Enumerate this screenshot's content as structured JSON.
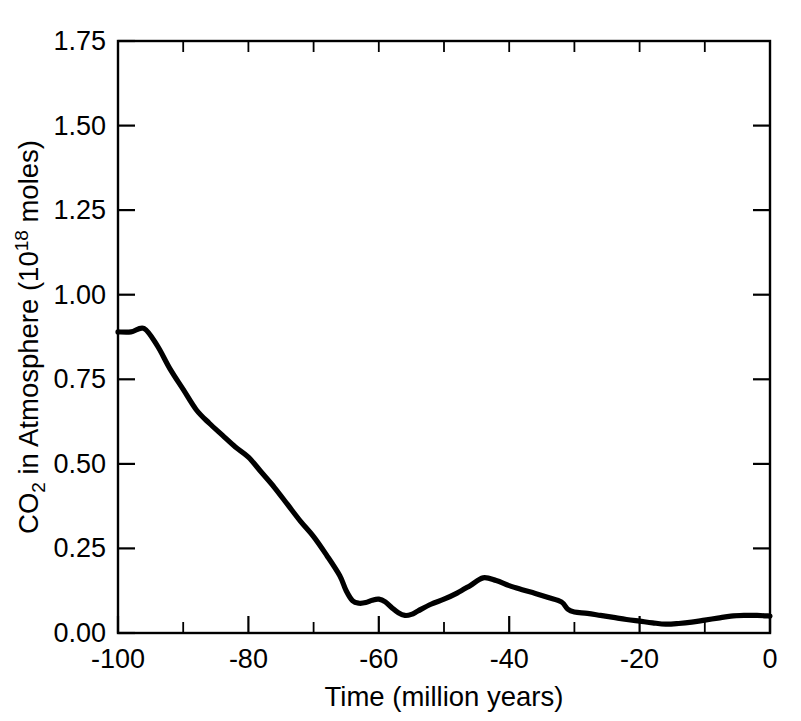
{
  "chart_data": {
    "type": "line",
    "title": "",
    "xlabel": "Time (million years)",
    "ylabel": "CO2 in Atmosphere (10^18 moles)",
    "ylabel_parts": {
      "prefix": "CO",
      "subscript": "2",
      "middle": " in Atmosphere (10",
      "superscript": "18",
      "suffix": " moles)"
    },
    "xlim": [
      -100,
      0
    ],
    "ylim": [
      0.0,
      1.75
    ],
    "xticks": [
      -100,
      -80,
      -60,
      -40,
      -20,
      0
    ],
    "xticklabels": [
      "-100",
      "-80",
      "-60",
      "-40",
      "-20",
      "0"
    ],
    "xticks_minor": [
      -90,
      -70,
      -50,
      -30,
      -10
    ],
    "yticks": [
      0.0,
      0.25,
      0.5,
      0.75,
      1.0,
      1.25,
      1.5,
      1.75
    ],
    "yticklabels": [
      "0.00",
      "0.25",
      "0.50",
      "0.75",
      "1.00",
      "1.25",
      "1.50",
      "1.75"
    ],
    "grid": false,
    "legend": false,
    "line_color": "#000000",
    "background_color": "#ffffff",
    "series": [
      {
        "name": "CO2 in Atmosphere",
        "x": [
          -100,
          -98,
          -96,
          -94,
          -92,
          -90,
          -88,
          -86,
          -84,
          -82,
          -80,
          -78,
          -76,
          -74,
          -72,
          -70,
          -68,
          -66,
          -65,
          -64,
          -63,
          -62,
          -61,
          -60,
          -59,
          -58,
          -57,
          -56,
          -55,
          -54,
          -52,
          -50,
          -48,
          -46,
          -44,
          -42,
          -40,
          -38,
          -36,
          -34,
          -32,
          -31,
          -30,
          -28,
          -26,
          -24,
          -22,
          -20,
          -18,
          -16,
          -14,
          -12,
          -10,
          -8,
          -6,
          -4,
          -2,
          0
        ],
        "y": [
          0.89,
          0.89,
          0.9,
          0.85,
          0.78,
          0.72,
          0.66,
          0.62,
          0.585,
          0.55,
          0.52,
          0.475,
          0.43,
          0.38,
          0.33,
          0.285,
          0.23,
          0.17,
          0.125,
          0.095,
          0.088,
          0.09,
          0.097,
          0.1,
          0.092,
          0.075,
          0.06,
          0.052,
          0.055,
          0.065,
          0.085,
          0.1,
          0.118,
          0.14,
          0.163,
          0.155,
          0.14,
          0.128,
          0.117,
          0.105,
          0.092,
          0.07,
          0.062,
          0.058,
          0.052,
          0.046,
          0.04,
          0.035,
          0.03,
          0.026,
          0.028,
          0.032,
          0.038,
          0.044,
          0.05,
          0.052,
          0.052,
          0.05
        ]
      }
    ]
  },
  "figure": {
    "xlabel": "Time (million years)",
    "ylabel_prefix": "CO",
    "ylabel_sub": "2",
    "ylabel_middle": " in Atmosphere (10",
    "ylabel_sup": "18",
    "ylabel_suffix": " moles)"
  }
}
